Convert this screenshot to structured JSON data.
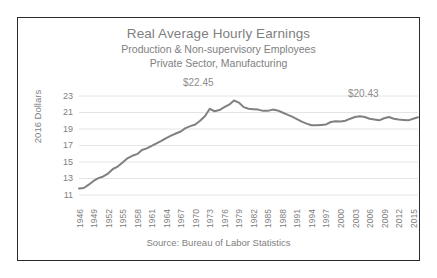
{
  "chart_data": {
    "type": "line",
    "title": "Real Average Hourly Earnings",
    "subtitle_1": "Production & Non-supervisory Employees",
    "subtitle_2": "Private Sector, Manufacturing",
    "xlabel": "",
    "ylabel": "2016 Dollars",
    "ylim": [
      11,
      23
    ],
    "yticks": [
      11,
      13,
      15,
      17,
      19,
      21,
      23
    ],
    "xlim": [
      1946,
      2016
    ],
    "xticks": [
      1946,
      1949,
      1952,
      1955,
      1958,
      1961,
      1964,
      1967,
      1970,
      1973,
      1976,
      1979,
      1982,
      1985,
      1988,
      1991,
      1994,
      1997,
      2000,
      2003,
      2006,
      2009,
      2012,
      2015
    ],
    "grid": true,
    "legend": "none",
    "source_note": "Source: Bureau of Labor Statistics",
    "line_color": "#808080",
    "text_color": "#808080",
    "annotations": [
      {
        "id": "peak",
        "label": "$22.45",
        "year": 1978,
        "value": 22.45
      },
      {
        "id": "last",
        "label": "$20.43",
        "year": 2016,
        "value": 20.43
      }
    ],
    "series": [
      {
        "name": "Real Average Hourly Earnings",
        "x": [
          1946,
          1947,
          1948,
          1949,
          1950,
          1951,
          1952,
          1953,
          1954,
          1955,
          1956,
          1957,
          1958,
          1959,
          1960,
          1961,
          1962,
          1963,
          1964,
          1965,
          1966,
          1967,
          1968,
          1969,
          1970,
          1971,
          1972,
          1973,
          1974,
          1975,
          1976,
          1977,
          1978,
          1979,
          1980,
          1981,
          1982,
          1983,
          1984,
          1985,
          1986,
          1987,
          1988,
          1989,
          1990,
          1991,
          1992,
          1993,
          1994,
          1995,
          1996,
          1997,
          1998,
          1999,
          2000,
          2001,
          2002,
          2003,
          2004,
          2005,
          2006,
          2007,
          2008,
          2009,
          2010,
          2011,
          2012,
          2013,
          2014,
          2015,
          2016
        ],
        "values": [
          11.8,
          11.85,
          12.25,
          12.7,
          13.05,
          13.25,
          13.6,
          14.15,
          14.45,
          14.95,
          15.45,
          15.75,
          15.95,
          16.45,
          16.65,
          16.95,
          17.25,
          17.55,
          17.9,
          18.2,
          18.45,
          18.7,
          19.1,
          19.35,
          19.55,
          20.0,
          20.55,
          21.45,
          21.15,
          21.3,
          21.65,
          21.95,
          22.45,
          22.2,
          21.65,
          21.45,
          21.4,
          21.35,
          21.2,
          21.2,
          21.35,
          21.25,
          21.0,
          20.75,
          20.5,
          20.2,
          19.9,
          19.65,
          19.45,
          19.45,
          19.5,
          19.55,
          19.85,
          19.95,
          19.9,
          20.0,
          20.25,
          20.45,
          20.55,
          20.45,
          20.25,
          20.15,
          20.05,
          20.3,
          20.45,
          20.25,
          20.15,
          20.1,
          20.05,
          20.25,
          20.43
        ]
      }
    ]
  }
}
